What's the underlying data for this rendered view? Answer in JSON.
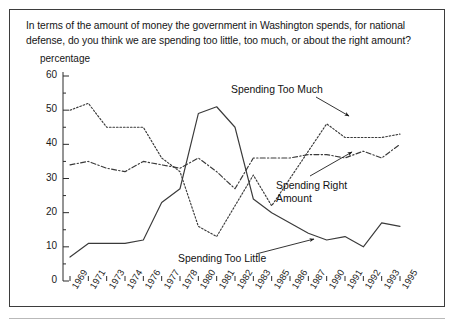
{
  "figure": {
    "question": "In terms of the amount of money the government in Washington spends, for national defense, do you think we are spending too little, too much, or about the right amount?",
    "percentage_label": "percentage"
  },
  "annotations": {
    "too_much": "Spending Too Much",
    "right_amount_line1": "Spending Right",
    "right_amount_line2": "Amount",
    "too_little": "Spending Too Little"
  },
  "chart_data": {
    "type": "line",
    "title": "In terms of the amount of money the government in Washington spends, for national defense, do you think we are spending too little, too much, or about the right amount?",
    "xlabel": "",
    "ylabel": "percentage",
    "ylim": [
      0,
      60
    ],
    "yticks": [
      0,
      10,
      20,
      30,
      40,
      50,
      60
    ],
    "yticklabels": [
      "0",
      "10",
      "20",
      "30",
      "40",
      "50",
      "60"
    ],
    "y_minor_ticks": [
      5,
      15,
      25,
      35,
      45,
      55
    ],
    "grid": false,
    "legend_position": "inline-annotations",
    "categories": [
      "1969",
      "1971",
      "1973",
      "1974",
      "1976",
      "1977",
      "1978",
      "1980",
      "1981",
      "1982",
      "1983",
      "1985",
      "1986",
      "1987",
      "1990",
      "1991",
      "1992",
      "1993",
      "1995"
    ],
    "series": [
      {
        "name": "Spending Too Much",
        "style": "dotted",
        "color": "#3a3a3a",
        "values": [
          50,
          52,
          45,
          45,
          45,
          36,
          32,
          16,
          13,
          22,
          31,
          22,
          30,
          38,
          46,
          42,
          42,
          42,
          43
        ]
      },
      {
        "name": "Spending Right Amount",
        "style": "dash-dot",
        "color": "#3a3a3a",
        "values": [
          34,
          35,
          33,
          32,
          35,
          34,
          33,
          36,
          32,
          27,
          36,
          36,
          36,
          37,
          37,
          36,
          38,
          36,
          40
        ]
      },
      {
        "name": "Spending Too Little",
        "style": "solid",
        "color": "#3a3a3a",
        "values": [
          7,
          11,
          11,
          11,
          12,
          23,
          27,
          49,
          51,
          45,
          24,
          20,
          17,
          14,
          12,
          13,
          10,
          17,
          16
        ]
      }
    ]
  }
}
